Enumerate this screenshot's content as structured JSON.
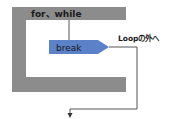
{
  "diagram": {
    "loop_label": "for、while",
    "break_label": "break",
    "exit_label": "Loopの外へ",
    "colors": {
      "loop_frame": "#8c8c8c",
      "break_fill": "#5b82c9",
      "line": "#555555",
      "text_dark": "#1a1a1a"
    }
  }
}
